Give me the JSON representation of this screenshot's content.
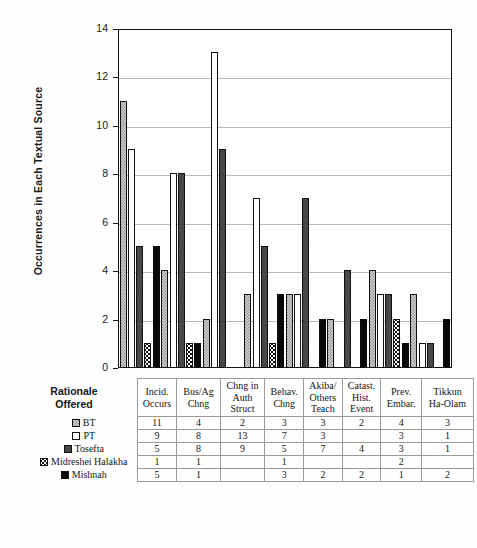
{
  "chart_data": {
    "type": "bar",
    "title": "",
    "xlabel": "Rationale Offered",
    "ylabel": "Occurrences in Each Textual Source",
    "ylim": [
      0,
      14
    ],
    "yticks": [
      0,
      2,
      4,
      6,
      8,
      10,
      12,
      14
    ],
    "grid": "horizontal",
    "legend_position": "table-row-labels",
    "categories": [
      "Incid. Occurs",
      "Bus/Ag Chng",
      "Chng in Auth Struct",
      "Behav. Chng",
      "Akiba/ Others Teach",
      "Catast. Hist. Event",
      "Prev. Embar.",
      "Tikkun Ha-Olam"
    ],
    "series": [
      {
        "name": "BT",
        "pattern": "light-checker",
        "values": [
          11,
          4,
          2,
          3,
          3,
          2,
          4,
          3
        ]
      },
      {
        "name": "PT",
        "pattern": "white",
        "values": [
          9,
          8,
          13,
          7,
          3,
          null,
          3,
          1
        ]
      },
      {
        "name": "Tosefta",
        "pattern": "dark-stipple",
        "values": [
          5,
          8,
          9,
          5,
          7,
          4,
          3,
          1
        ]
      },
      {
        "name": "Midreshei Halakha",
        "pattern": "black-dots",
        "values": [
          1,
          1,
          null,
          1,
          null,
          null,
          2,
          null
        ]
      },
      {
        "name": "Mishnah",
        "pattern": "solid-black",
        "values": [
          5,
          1,
          null,
          3,
          2,
          2,
          1,
          2
        ]
      }
    ]
  },
  "axis": {
    "y_title": "Occurrences in Each Textual Source",
    "y_tick_labels": [
      "14",
      "12",
      "10",
      "8",
      "6",
      "4",
      "2",
      "0"
    ]
  },
  "corner": {
    "line1": "Rationale",
    "line2": "Offered"
  },
  "table": {
    "headers": [
      {
        "l1": "Incid.",
        "l2": "Occurs",
        "l3": ""
      },
      {
        "l1": "Bus/Ag",
        "l2": "Chng",
        "l3": ""
      },
      {
        "l1": "Chng in",
        "l2": "Auth",
        "l3": "Struct"
      },
      {
        "l1": "Behav.",
        "l2": "Chng",
        "l3": ""
      },
      {
        "l1": "Akiba/",
        "l2": "Others",
        "l3": "Teach"
      },
      {
        "l1": "Catast.",
        "l2": "Hist.",
        "l3": "Event"
      },
      {
        "l1": "Prev.",
        "l2": "Embar.",
        "l3": ""
      },
      {
        "l1": "Tikkun",
        "l2": "Ha-Olam",
        "l3": ""
      }
    ],
    "rows": [
      {
        "label": "BT",
        "cells": [
          "11",
          "4",
          "2",
          "3",
          "3",
          "2",
          "4",
          "3"
        ]
      },
      {
        "label": "PT",
        "cells": [
          "9",
          "8",
          "13",
          "7",
          "3",
          "",
          "3",
          "1"
        ]
      },
      {
        "label": "Tosefta",
        "cells": [
          "5",
          "8",
          "9",
          "5",
          "7",
          "4",
          "3",
          "1"
        ]
      },
      {
        "label": "Midreshei Halakha",
        "cells": [
          "1",
          "1",
          "",
          "1",
          "",
          "",
          "2",
          ""
        ]
      },
      {
        "label": "Mishnah",
        "cells": [
          "5",
          "1",
          "",
          "3",
          "2",
          "2",
          "1",
          "2"
        ]
      }
    ]
  },
  "colors": {
    "axis": "#111111",
    "gridline": "#b9b9b9",
    "bt": "#d2d2d2",
    "pt": "#ffffff",
    "tosefta": "#5a5a5a",
    "midreshei": "#111111",
    "mishnah": "#090909"
  }
}
